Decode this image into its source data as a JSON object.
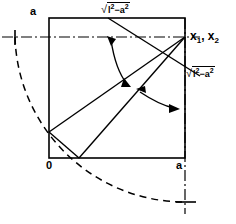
{
  "figure": {
    "name": "geometric-construction-square-arc",
    "background_color": "#ffffff",
    "stroke_color": "#000000",
    "width": 236,
    "height": 224,
    "labels": {
      "a_top_left": "a",
      "a_bottom_right": "a",
      "origin": "0",
      "solutions": "x",
      "solutions_sub1": "1",
      "solutions_sub_sep": ", x",
      "solutions_sub2": "2",
      "radical_sign": "√",
      "radical_top_body_l": "l",
      "radical_top_body_exp1": "2",
      "radical_top_body_minus": "−a",
      "radical_top_body_exp2": "2",
      "radical_side_body_l": "l",
      "radical_side_body_exp1": "2",
      "radical_side_body_minus": "−a",
      "radical_side_body_exp2": "2"
    },
    "geometry": {
      "square": {
        "left": 49,
        "top": 18,
        "right": 185,
        "bottom": 158
      },
      "corner_top_right": [
        185,
        18
      ],
      "corner_bottom_left": [
        49,
        158
      ],
      "vertex_left_edge": [
        49,
        132
      ],
      "vertex_bottom_edge": [
        79,
        158
      ],
      "dashdot_horizontal_y": 37,
      "dashdot_vertical_x": 185,
      "tick_left": [
        15,
        37
      ],
      "tick_bottom": [
        185,
        202
      ],
      "arc_center": [
        185,
        37
      ],
      "arc_radius": 170,
      "angle_arrow_1": "curved-double-arrow-upper",
      "angle_arrow_2": "curved-double-arrow-lower"
    }
  }
}
